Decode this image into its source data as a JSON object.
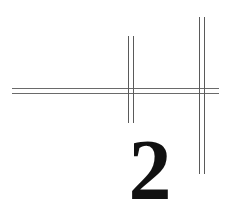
{
  "chapter": {
    "number": "2"
  },
  "colors": {
    "background": "#ffffff",
    "rule_lines": "#6a6a6a",
    "numeral": "#111111"
  }
}
